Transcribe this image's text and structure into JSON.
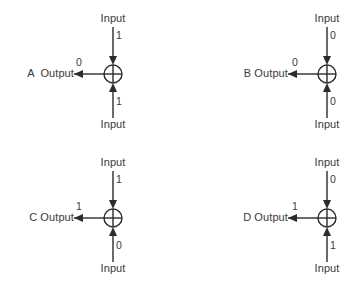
{
  "figure": {
    "background_color": "#ffffff",
    "stroke_color": "#2b2b2b",
    "text_color": "#3a3a3a",
    "gate_symbol": "circled-plus"
  },
  "common": {
    "input_label": "Input",
    "output_suffix": "Output"
  },
  "panels": [
    {
      "id": "a",
      "letter": "A",
      "output_label": "A  Output",
      "input_top_label": "Input",
      "input_bottom_label": "Input",
      "input_top_value": "1",
      "input_bottom_value": "1",
      "output_value": "0"
    },
    {
      "id": "b",
      "letter": "B",
      "output_label": "B Output",
      "input_top_label": "Input",
      "input_bottom_label": "Input",
      "input_top_value": "0",
      "input_bottom_value": "0",
      "output_value": "0"
    },
    {
      "id": "c",
      "letter": "C",
      "output_label": "C Output",
      "input_top_label": "Input",
      "input_bottom_label": "Input",
      "input_top_value": "1",
      "input_bottom_value": "0",
      "output_value": "1"
    },
    {
      "id": "d",
      "letter": "D",
      "output_label": "D Output",
      "input_top_label": "Input",
      "input_bottom_label": "Input",
      "input_top_value": "0",
      "input_bottom_value": "1",
      "output_value": "1"
    }
  ]
}
